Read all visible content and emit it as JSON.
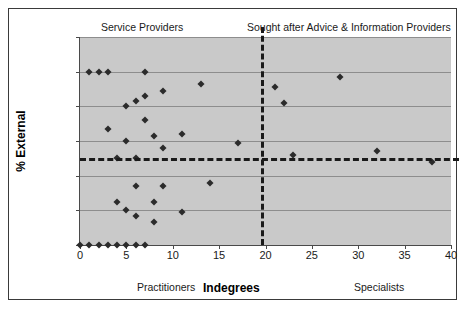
{
  "chart_data": {
    "type": "scatter",
    "title": "",
    "xlabel": "Indegrees",
    "ylabel": "% External",
    "xlim": [
      0,
      40
    ],
    "ylim": [
      0,
      120
    ],
    "xticks": [
      0,
      5,
      10,
      15,
      20,
      25,
      30,
      35,
      40
    ],
    "yticks": [
      0,
      20,
      40,
      60,
      80,
      100,
      120
    ],
    "grid": "horizontal",
    "legend": "none",
    "plot_background": "#c9c9c9",
    "marker_color": "#2b2b2b",
    "marker_shape": "diamond",
    "reference_lines": [
      {
        "name": "vertical-divider",
        "orientation": "vertical",
        "value": 19.5,
        "style": "dashed"
      },
      {
        "name": "horizontal-divider",
        "orientation": "horizontal",
        "value": 50,
        "style": "dashed"
      }
    ],
    "annotations": [
      {
        "name": "service-providers",
        "text": "Service Providers",
        "quadrant": "top-left"
      },
      {
        "name": "sought-after",
        "text": "Sought after Advice & Information Providers",
        "quadrant": "top-right"
      },
      {
        "name": "practitioners",
        "text": "Practitioners",
        "quadrant": "bottom-left-axis"
      },
      {
        "name": "specialists",
        "text": "Specialists",
        "quadrant": "bottom-right-axis"
      }
    ],
    "points": [
      {
        "x": 0,
        "y": 0
      },
      {
        "x": 1,
        "y": 0
      },
      {
        "x": 2,
        "y": 0
      },
      {
        "x": 3,
        "y": 0
      },
      {
        "x": 4,
        "y": 0
      },
      {
        "x": 5,
        "y": 0
      },
      {
        "x": 6,
        "y": 0
      },
      {
        "x": 7,
        "y": 0
      },
      {
        "x": 1,
        "y": 100
      },
      {
        "x": 2,
        "y": 100
      },
      {
        "x": 3,
        "y": 100
      },
      {
        "x": 7,
        "y": 100
      },
      {
        "x": 3,
        "y": 67
      },
      {
        "x": 4,
        "y": 25
      },
      {
        "x": 4,
        "y": 50
      },
      {
        "x": 5,
        "y": 80
      },
      {
        "x": 5,
        "y": 60
      },
      {
        "x": 5,
        "y": 20
      },
      {
        "x": 6,
        "y": 83
      },
      {
        "x": 6,
        "y": 34
      },
      {
        "x": 6,
        "y": 17
      },
      {
        "x": 6,
        "y": 50
      },
      {
        "x": 7,
        "y": 86
      },
      {
        "x": 7,
        "y": 72
      },
      {
        "x": 8,
        "y": 63
      },
      {
        "x": 8,
        "y": 25
      },
      {
        "x": 8,
        "y": 13
      },
      {
        "x": 9,
        "y": 89
      },
      {
        "x": 9,
        "y": 56
      },
      {
        "x": 9,
        "y": 34
      },
      {
        "x": 11,
        "y": 64
      },
      {
        "x": 11,
        "y": 19
      },
      {
        "x": 13,
        "y": 93
      },
      {
        "x": 14,
        "y": 36
      },
      {
        "x": 17,
        "y": 59
      },
      {
        "x": 21,
        "y": 91
      },
      {
        "x": 22,
        "y": 82
      },
      {
        "x": 23,
        "y": 52
      },
      {
        "x": 28,
        "y": 97
      },
      {
        "x": 32,
        "y": 54
      },
      {
        "x": 38,
        "y": 48
      }
    ]
  }
}
